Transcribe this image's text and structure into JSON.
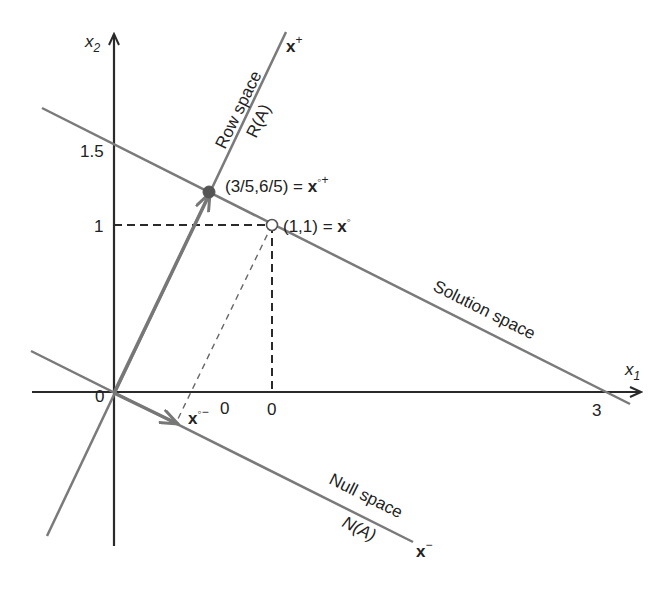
{
  "diagram": {
    "axes": {
      "x1_label": "x",
      "x1_sub": "1",
      "x2_label": "x",
      "x2_sub": "2",
      "origin_label": "0",
      "ticks": {
        "y_1_5": "1.5",
        "y_1": "1",
        "x_3": "3",
        "x_zero_a": "0",
        "x_zero_b": "0"
      }
    },
    "lines": {
      "row_space": {
        "label": "Row space",
        "sublabel": "R(A)",
        "end_label": "x",
        "end_sup": "+"
      },
      "solution_space": {
        "label": "Solution space"
      },
      "null_space": {
        "label": "Null space",
        "sublabel": "N(A)",
        "end_label": "x",
        "end_sup": "−"
      }
    },
    "points": {
      "x_o_plus": {
        "coords": "(3/5,6/5) = ",
        "symbol": "x",
        "sup": "◦+"
      },
      "x_o": {
        "coords": "(1,1) = ",
        "symbol": "x",
        "sup": "◦"
      },
      "x_o_minus": {
        "symbol": "x",
        "sup": "◦−"
      }
    },
    "colors": {
      "axis": "#2a2a2a",
      "line": "#7a7a7a",
      "dashed": "#2a2a2a"
    }
  }
}
